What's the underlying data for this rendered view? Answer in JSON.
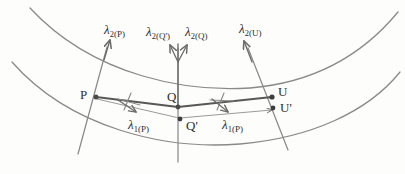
{
  "figure": {
    "caption": "",
    "kind": "geometric-diagram",
    "stroke_color": "#6b6b6b",
    "heavy_stroke_color": "#4a4a4a",
    "text_color": "#2f2f2f",
    "background": "#fdfdfc",
    "width": 405,
    "height": 174
  },
  "curves": {
    "outer_arc_label": "outer-geodesic-arc",
    "inner_arc_label": "inner-geodesic-arc"
  },
  "points": {
    "P": {
      "label": "P",
      "x": 95,
      "y": 97
    },
    "Q": {
      "label": "Q",
      "x": 178,
      "y": 106
    },
    "Q_prime": {
      "label": "Q'",
      "x": 180,
      "y": 124
    },
    "U": {
      "label": "U",
      "x": 272,
      "y": 96
    },
    "U_prime": {
      "label": "U'",
      "x": 274,
      "y": 109
    }
  },
  "vectors": {
    "lambda2_P": {
      "greek": "λ",
      "sub": "2",
      "arg": "(P)"
    },
    "lambda2_Qprime": {
      "greek": "λ",
      "sub": "2",
      "arg": "(Q')"
    },
    "lambda2_Q": {
      "greek": "λ",
      "sub": "2",
      "arg": "(Q)"
    },
    "lambda2_U": {
      "greek": "λ",
      "sub": "2",
      "arg": "(U)"
    },
    "lambda1_P_left": {
      "greek": "λ",
      "sub": "1",
      "arg": "(P)"
    },
    "lambda1_P_right": {
      "greek": "λ",
      "sub": "1",
      "arg": "(P)"
    }
  }
}
